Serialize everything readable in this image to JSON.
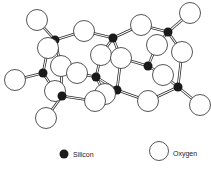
{
  "diagram": {
    "colors": {
      "silicon": "#1a1a1a",
      "oxygen_fill": "#ffffff",
      "stroke": "#2a2a2a",
      "background": "#ffffff"
    },
    "silicon_atoms": [
      {
        "x": 55,
        "y": 40
      },
      {
        "x": 113,
        "y": 38
      },
      {
        "x": 168,
        "y": 32
      },
      {
        "x": 43,
        "y": 73
      },
      {
        "x": 96,
        "y": 77
      },
      {
        "x": 148,
        "y": 66
      },
      {
        "x": 62,
        "y": 96
      },
      {
        "x": 117,
        "y": 90
      },
      {
        "x": 178,
        "y": 87
      }
    ],
    "oxygen_atoms": [
      {
        "x": 37,
        "y": 20
      },
      {
        "x": 84,
        "y": 31
      },
      {
        "x": 141,
        "y": 25
      },
      {
        "x": 190,
        "y": 13
      },
      {
        "x": 48,
        "y": 48
      },
      {
        "x": 157,
        "y": 45
      },
      {
        "x": 182,
        "y": 52
      },
      {
        "x": 101,
        "y": 55
      },
      {
        "x": 121,
        "y": 58
      },
      {
        "x": 77,
        "y": 73
      },
      {
        "x": 61,
        "y": 66
      },
      {
        "x": 163,
        "y": 75
      },
      {
        "x": 15,
        "y": 80
      },
      {
        "x": 55,
        "y": 91
      },
      {
        "x": 105,
        "y": 94
      },
      {
        "x": 95,
        "y": 101
      },
      {
        "x": 148,
        "y": 101
      },
      {
        "x": 200,
        "y": 105
      },
      {
        "x": 46,
        "y": 118
      }
    ],
    "bonds": [
      [
        37,
        20,
        55,
        40
      ],
      [
        84,
        31,
        55,
        40
      ],
      [
        84,
        31,
        113,
        38
      ],
      [
        141,
        25,
        113,
        38
      ],
      [
        141,
        25,
        168,
        32
      ],
      [
        190,
        13,
        168,
        32
      ],
      [
        48,
        48,
        55,
        40
      ],
      [
        55,
        40,
        61,
        66
      ],
      [
        48,
        48,
        43,
        73
      ],
      [
        15,
        80,
        43,
        73
      ],
      [
        43,
        73,
        55,
        91
      ],
      [
        61,
        66,
        62,
        96
      ],
      [
        55,
        91,
        62,
        96
      ],
      [
        62,
        96,
        46,
        118
      ],
      [
        62,
        96,
        95,
        101
      ],
      [
        101,
        55,
        113,
        38
      ],
      [
        113,
        38,
        121,
        58
      ],
      [
        101,
        55,
        96,
        77
      ],
      [
        77,
        73,
        96,
        77
      ],
      [
        96,
        77,
        105,
        94
      ],
      [
        96,
        77,
        117,
        90
      ],
      [
        121,
        58,
        117,
        90
      ],
      [
        117,
        90,
        95,
        101
      ],
      [
        117,
        90,
        148,
        101
      ],
      [
        121,
        58,
        148,
        66
      ],
      [
        157,
        45,
        168,
        32
      ],
      [
        168,
        32,
        182,
        52
      ],
      [
        157,
        45,
        148,
        66
      ],
      [
        148,
        66,
        163,
        75
      ],
      [
        182,
        52,
        178,
        87
      ],
      [
        163,
        75,
        178,
        87
      ],
      [
        148,
        101,
        178,
        87
      ],
      [
        178,
        87,
        200,
        105
      ]
    ]
  },
  "legend": {
    "silicon": {
      "label": "Silicon",
      "x": 64,
      "y": 154
    },
    "oxygen": {
      "label": "Oxygen",
      "x": 159,
      "y": 151
    }
  }
}
